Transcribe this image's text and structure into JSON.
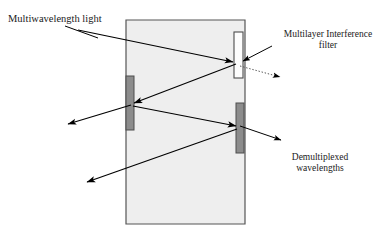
{
  "figure": {
    "type": "optical-diagram",
    "background_color": "#ffffff",
    "block": {
      "name": "glass-substrate-block",
      "fill_color": "#eeeeee",
      "stroke_color": "#555555",
      "corners": [
        [
          126,
          20
        ],
        [
          245,
          20
        ],
        [
          245,
          224
        ],
        [
          126,
          224
        ]
      ],
      "top_offset_x": 6
    },
    "filters": [
      {
        "name": "filter-top-right",
        "style": "outlined",
        "fill_color": "#ffffff",
        "stroke_color": "#4d4d4d",
        "x": 234,
        "y": 32,
        "width": 9,
        "height": 46
      },
      {
        "name": "filter-left",
        "style": "filled",
        "fill_color": "#8c8c8c",
        "stroke_color": "#4d4d4d",
        "x": 126,
        "y": 76,
        "width": 8,
        "height": 54
      },
      {
        "name": "filter-bottom-right",
        "style": "filled",
        "fill_color": "#8c8c8c",
        "stroke_color": "#4d4d4d",
        "x": 236,
        "y": 103,
        "width": 8,
        "height": 50
      }
    ],
    "rays": [
      {
        "name": "ray-input-multiwavelength",
        "style": "solid",
        "from": [
          78,
          30
        ],
        "to": [
          234,
          62
        ],
        "arrow": "end"
      },
      {
        "name": "ray-reflected-to-left-filter",
        "style": "solid",
        "from": [
          236,
          64
        ],
        "to": [
          133,
          104
        ],
        "arrow": "end"
      },
      {
        "name": "ray-transmitted-out-upper-left",
        "style": "solid",
        "from": [
          131,
          105
        ],
        "to": [
          68,
          124
        ],
        "arrow": "end"
      },
      {
        "name": "ray-reflected-to-bottom-right-filter",
        "style": "solid",
        "from": [
          133,
          106
        ],
        "to": [
          236,
          126
        ],
        "arrow": "end"
      },
      {
        "name": "ray-transmitted-out-lower-left",
        "style": "solid",
        "from": [
          237,
          129
        ],
        "to": [
          86,
          183
        ],
        "arrow": "end"
      },
      {
        "name": "ray-transmitted-dotted-out-right",
        "style": "dotted",
        "from": [
          240,
          66
        ],
        "to": [
          283,
          78
        ],
        "arrow": "end"
      }
    ],
    "leaders": [
      {
        "name": "leader-multiwavelength",
        "style": "solid",
        "from": [
          65,
          26
        ],
        "to": [
          96,
          37
        ],
        "arrow": "none"
      },
      {
        "name": "leader-filter",
        "style": "solid",
        "from": [
          272,
          46
        ],
        "to": [
          242,
          62
        ],
        "arrow": "end"
      },
      {
        "name": "leader-demultiplexed",
        "style": "solid",
        "from": [
          240,
          126
        ],
        "to": [
          283,
          141
        ],
        "arrow": "end"
      }
    ],
    "labels": {
      "multiwavelength": "Multiwavelength light",
      "filter_line1": "Multilayer Interference",
      "filter_line2": "filter",
      "demux_line1": "Demultiplexed",
      "demux_line2": "wavelengths"
    }
  }
}
